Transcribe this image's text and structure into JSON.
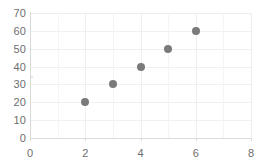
{
  "chart_data": {
    "type": "scatter",
    "title": "",
    "subtitle": "",
    "xlabel": "",
    "ylabel": "",
    "x": [
      2,
      3,
      4,
      5,
      6
    ],
    "values": [
      20,
      30,
      40,
      50,
      60
    ],
    "series": [
      {
        "name": "Series 1",
        "points": [
          {
            "x": 2,
            "y": 20
          },
          {
            "x": 3,
            "y": 30
          },
          {
            "x": 4,
            "y": 40
          },
          {
            "x": 5,
            "y": 50
          },
          {
            "x": 6,
            "y": 60
          }
        ]
      }
    ],
    "xlim": [
      0,
      8
    ],
    "ylim": [
      0,
      70
    ],
    "x_ticks": [
      0,
      2,
      4,
      6,
      8
    ],
    "y_ticks": [
      0,
      10,
      20,
      30,
      40,
      50,
      60,
      70
    ],
    "x_tick_labels": [
      "0",
      "2",
      "4",
      "6",
      "8"
    ],
    "y_tick_labels": [
      "0",
      "10",
      "20",
      "30",
      "40",
      "50",
      "60",
      "70"
    ],
    "x_minor_step": 1,
    "grid": {
      "horizontal": true,
      "vertical": true
    },
    "legend": {
      "visible": false,
      "position": "none"
    },
    "annotations": [],
    "colors": {
      "marker": "#7a7a7a",
      "gridline": "#f0f0f0",
      "gridline_minor": "#f4f4f4",
      "axis": "#d9d9d9",
      "tick_label": "#6e6e6e",
      "background": "#ffffff"
    },
    "marker_size_px": 8
  }
}
